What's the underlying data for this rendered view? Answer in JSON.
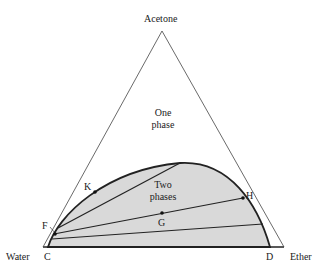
{
  "diagram": {
    "type": "ternary-phase-diagram",
    "vertices": {
      "top": "Acetone",
      "left": "Water",
      "right": "Ether"
    },
    "regions": {
      "one_phase": [
        "One",
        "phase"
      ],
      "two_phase": [
        "Two",
        "phases"
      ]
    },
    "points": {
      "C": "C",
      "D": "D",
      "F": "F",
      "K": "K",
      "G": "G",
      "H": "H"
    },
    "colors": {
      "two_phase_fill": "#d9d9d9",
      "line": "#222222"
    }
  }
}
